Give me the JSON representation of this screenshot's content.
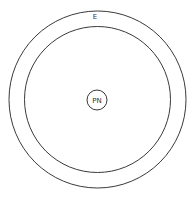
{
  "diagram": {
    "outer_label": "E",
    "nucleus_label": "PN",
    "stroke_color": "#3a3a3a",
    "background": "#ffffff"
  }
}
